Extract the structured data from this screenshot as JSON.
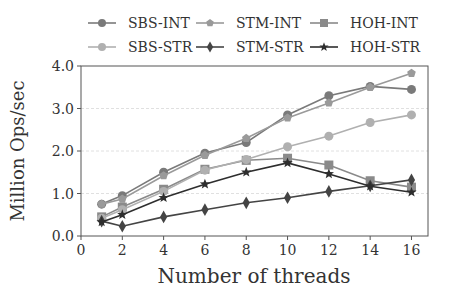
{
  "chart_data": {
    "type": "line",
    "title": "",
    "xlabel": "Number of threads",
    "ylabel": "Million Ops/sec",
    "xlim": [
      0,
      16.8
    ],
    "ylim": [
      0.0,
      4.0
    ],
    "xticks": [
      0,
      2,
      4,
      6,
      8,
      10,
      12,
      14,
      16
    ],
    "yticks": [
      0.0,
      1.0,
      2.0,
      3.0,
      4.0
    ],
    "ytick_labels": [
      "0.0",
      "1.0",
      "2.0",
      "3.0",
      "4.0"
    ],
    "grid": "horizontal dashed",
    "legend_position": "top, outside, 3 columns",
    "x": [
      1,
      2,
      4,
      6,
      8,
      10,
      12,
      14,
      16
    ],
    "series": [
      {
        "name": "SBS-INT",
        "marker": "circle",
        "color": "#7a7a7a",
        "values": [
          0.75,
          0.95,
          1.5,
          1.95,
          2.2,
          2.85,
          3.3,
          3.52,
          3.45
        ]
      },
      {
        "name": "STM-INT",
        "marker": "pentagon",
        "color": "#9a9a9a",
        "values": [
          0.75,
          0.87,
          1.42,
          1.9,
          2.3,
          2.78,
          3.13,
          3.5,
          3.83
        ]
      },
      {
        "name": "HOH-INT",
        "marker": "square",
        "color": "#8a8a8a",
        "values": [
          0.45,
          0.68,
          1.1,
          1.57,
          1.78,
          1.83,
          1.67,
          1.3,
          1.15
        ]
      },
      {
        "name": "SBS-STR",
        "marker": "circle",
        "color": "#b0b0b0",
        "values": [
          0.42,
          0.62,
          1.05,
          1.55,
          1.8,
          2.1,
          2.35,
          2.67,
          2.85
        ]
      },
      {
        "name": "STM-STR",
        "marker": "diamond",
        "color": "#444444",
        "values": [
          0.35,
          0.23,
          0.45,
          0.62,
          0.78,
          0.9,
          1.05,
          1.18,
          1.32
        ]
      },
      {
        "name": "HOH-STR",
        "marker": "star",
        "color": "#2e2e2e",
        "values": [
          0.33,
          0.5,
          0.9,
          1.22,
          1.5,
          1.72,
          1.46,
          1.17,
          1.03
        ]
      }
    ]
  }
}
